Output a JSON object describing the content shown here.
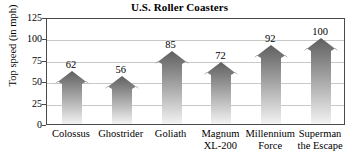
{
  "chart_data": {
    "type": "bar",
    "title": "U.S. Roller Coasters",
    "xlabel": "",
    "ylabel": "Top speed (in mph)",
    "categories": [
      "Colossus",
      "Ghostrider",
      "Goliath",
      "Magnum\nXL-200",
      "Millennium\nForce",
      "Superman\nthe Escape"
    ],
    "values": [
      62,
      56,
      85,
      72,
      92,
      100
    ],
    "value_labels": [
      "62",
      "56",
      "85",
      "72",
      "92",
      "100"
    ],
    "ylim": [
      0,
      125
    ],
    "yticks": [
      0,
      25,
      50,
      75,
      100,
      125
    ],
    "ytick_labels": [
      "0",
      "25",
      "50",
      "75",
      "100",
      "125"
    ],
    "grid": true,
    "legend": false,
    "bar_style": "arrow",
    "colors": {
      "bar_top": "#5f5f5f",
      "bar_bottom": "#f2f2f2",
      "gridline": "#c8c8c8",
      "frame": "#4a4a4a",
      "text": "#000000",
      "background": "#ffffff"
    }
  }
}
